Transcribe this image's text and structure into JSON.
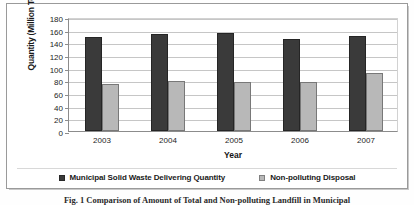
{
  "chart_data": {
    "type": "bar",
    "title": "",
    "xlabel": "Year",
    "ylabel": "Quantity (Million Tons)",
    "categories": [
      "2003",
      "2004",
      "2005",
      "2006",
      "2007"
    ],
    "series": [
      {
        "name": "Municipal Solid Waste Delivering Quantity",
        "color": "#3a3a3a",
        "values": [
          148,
          153,
          154,
          146,
          150
        ]
      },
      {
        "name": "Non-polluting Disposal",
        "color": "#b8b8b8",
        "values": [
          75,
          79,
          78,
          78,
          92
        ]
      }
    ],
    "ylim": [
      0,
      180
    ],
    "ytick_step": 20,
    "yticks": [
      "180",
      "160",
      "140",
      "120",
      "100",
      "80",
      "60",
      "40",
      "20",
      "0"
    ],
    "grid": true,
    "legend_position": "bottom"
  },
  "legend": {
    "items": [
      {
        "label": "Municipal Solid Waste Delivering Quantity",
        "color": "#3a3a3a"
      },
      {
        "label": "Non-polluting Disposal",
        "color": "#b8b8b8"
      }
    ]
  },
  "caption": {
    "text": "Fig. 1  Comparison of Amount of Total and Non-polluting Landfill in Municipal"
  }
}
